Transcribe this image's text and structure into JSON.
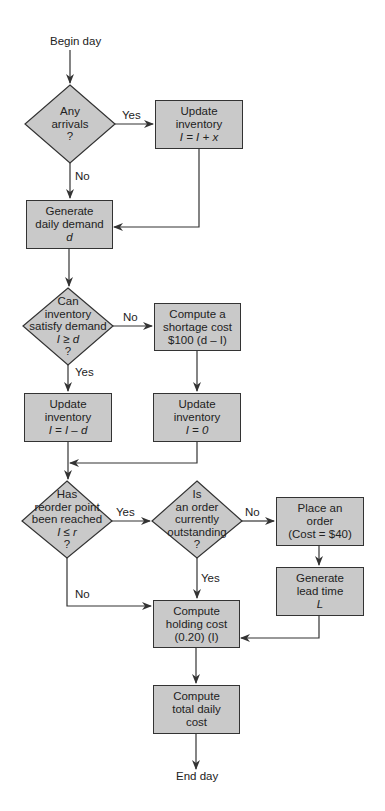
{
  "diagram": {
    "start": "Begin day",
    "end": "End day",
    "decisions": [
      {
        "id": "arrivals",
        "lines": [
          "Any",
          "arrivals",
          "?"
        ]
      },
      {
        "id": "satisfy",
        "lines": [
          "Can",
          "inventory",
          "satisfy demand",
          "I ≥ d",
          "?"
        ]
      },
      {
        "id": "reorder",
        "lines": [
          "Has",
          "reorder point",
          "been reached",
          "I ≤ r",
          "?"
        ]
      },
      {
        "id": "outstanding",
        "lines": [
          "Is",
          "an order",
          "currently",
          "outstanding",
          "?"
        ]
      }
    ],
    "processes": [
      {
        "id": "update_arrival",
        "lines": [
          "Update inventory",
          "I = I + x"
        ]
      },
      {
        "id": "generate_demand",
        "lines": [
          "Generate",
          "daily demand",
          "d"
        ]
      },
      {
        "id": "shortage",
        "lines": [
          "Compute a",
          "shortage cost",
          "$100 (d – I)"
        ]
      },
      {
        "id": "update_sub",
        "lines": [
          "Update inventory",
          "I = I – d"
        ]
      },
      {
        "id": "update_zero",
        "lines": [
          "Update inventory",
          "I = 0"
        ]
      },
      {
        "id": "place_order",
        "lines": [
          "Place an",
          "order",
          "(Cost = $40)"
        ]
      },
      {
        "id": "lead_time",
        "lines": [
          "Generate",
          "lead time",
          "L"
        ]
      },
      {
        "id": "holding",
        "lines": [
          "Compute",
          "holding cost",
          "(0.20) (I)"
        ]
      },
      {
        "id": "total",
        "lines": [
          "Compute",
          "total daily",
          "cost"
        ]
      }
    ],
    "edge_labels": {
      "arrivals_yes": "Yes",
      "arrivals_no": "No",
      "satisfy_no": "No",
      "satisfy_yes": "Yes",
      "reorder_yes": "Yes",
      "reorder_no": "No",
      "outstanding_no": "No",
      "outstanding_yes": "Yes"
    },
    "colors": {
      "fill": "#c9c9c9",
      "stroke": "#333333",
      "background": "#ffffff"
    }
  }
}
